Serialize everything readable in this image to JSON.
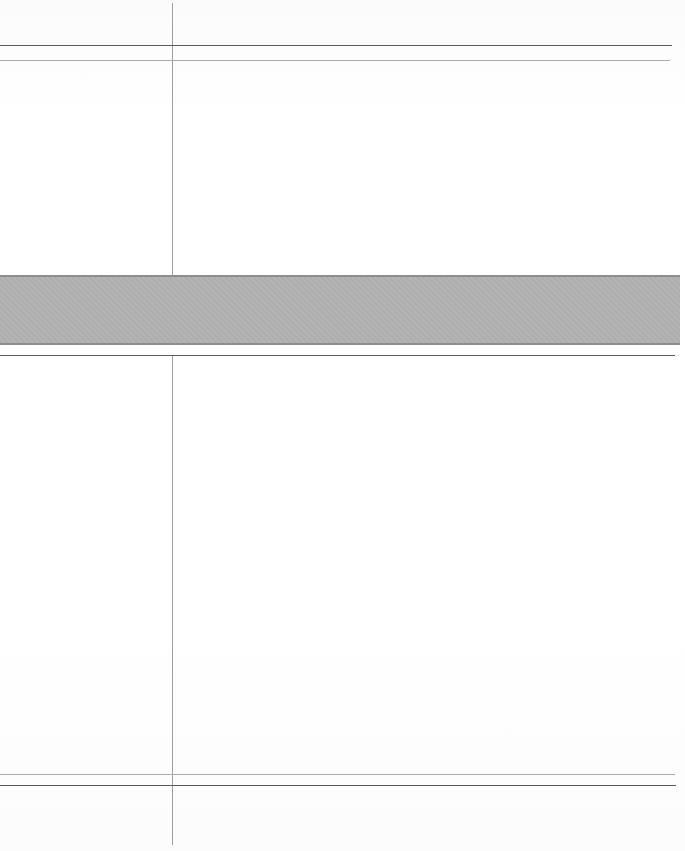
{
  "document": {
    "kind": "scanned-page",
    "page_width_px": 685,
    "page_height_px": 851,
    "background_color": "#fdfdfd",
    "visible_text": "",
    "note": "Blank scanned form page: no legible text, numbers, labels or glyphs are rendered in the pixels."
  },
  "palette": {
    "paper": "#fdfdfd",
    "rule_dark": "#555a5e",
    "rule_light": "#a8aeb2",
    "rule_vertical": "#9b9fa3",
    "band_fill": "#b1b1b1",
    "band_edge": "#8d8d8d"
  },
  "rules": {
    "vertical": [
      {
        "name": "column-divider",
        "x": 172,
        "y_top": 3,
        "y_bottom": 845,
        "weight": "light",
        "color": "#9b9fa3"
      }
    ],
    "horizontal": [
      {
        "name": "header-rule-upper",
        "y": 45,
        "x_start": 0,
        "x_end": 672,
        "weight": "dark",
        "color": "#555a5e"
      },
      {
        "name": "header-rule-lower",
        "y": 60,
        "x_start": 0,
        "x_end": 670,
        "weight": "light",
        "color": "#a8aeb2"
      },
      {
        "name": "band-under-rule",
        "y": 355,
        "x_start": 0,
        "x_end": 675,
        "weight": "dark",
        "color": "#555a5e"
      },
      {
        "name": "footer-rule-upper",
        "y": 774,
        "x_start": 0,
        "x_end": 675,
        "weight": "light",
        "color": "#a8aeb2"
      },
      {
        "name": "footer-rule-lower",
        "y": 785,
        "x_start": 0,
        "x_end": 676,
        "weight": "dark",
        "color": "#555a5e"
      }
    ]
  },
  "band": {
    "name": "shaded-separator-band",
    "y_top": 275,
    "y_bottom": 345,
    "height": 70,
    "x_start": 0,
    "x_end": 680,
    "fill": "#b1b1b1",
    "edge": "#8d8d8d",
    "label": ""
  },
  "regions": [
    {
      "name": "header-left-cell",
      "x": 0,
      "y": 0,
      "w": 172,
      "h": 45,
      "content": ""
    },
    {
      "name": "header-right-cell",
      "x": 173,
      "y": 0,
      "w": 512,
      "h": 45,
      "content": ""
    },
    {
      "name": "subheader-left",
      "x": 0,
      "y": 46,
      "w": 172,
      "h": 14,
      "content": ""
    },
    {
      "name": "subheader-right",
      "x": 173,
      "y": 46,
      "w": 512,
      "h": 14,
      "content": ""
    },
    {
      "name": "upper-body-left",
      "x": 0,
      "y": 61,
      "w": 172,
      "h": 214,
      "content": ""
    },
    {
      "name": "upper-body-right",
      "x": 173,
      "y": 61,
      "w": 512,
      "h": 214,
      "content": ""
    },
    {
      "name": "lower-body-left",
      "x": 0,
      "y": 356,
      "w": 172,
      "h": 418,
      "content": ""
    },
    {
      "name": "lower-body-right",
      "x": 173,
      "y": 356,
      "w": 512,
      "h": 418,
      "content": ""
    },
    {
      "name": "footer-strip-left",
      "x": 0,
      "y": 775,
      "w": 172,
      "h": 10,
      "content": ""
    },
    {
      "name": "footer-strip-right",
      "x": 173,
      "y": 775,
      "w": 512,
      "h": 10,
      "content": ""
    },
    {
      "name": "footer-left-cell",
      "x": 0,
      "y": 786,
      "w": 172,
      "h": 65,
      "content": ""
    },
    {
      "name": "footer-right-cell",
      "x": 173,
      "y": 786,
      "w": 512,
      "h": 65,
      "content": ""
    }
  ]
}
